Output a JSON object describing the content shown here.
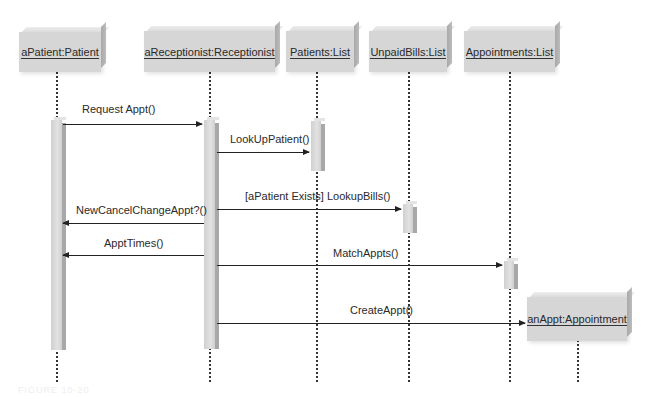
{
  "diagram": {
    "type": "UML sequence diagram",
    "objects": [
      {
        "id": "patient",
        "label": "aPatient:Patient"
      },
      {
        "id": "receptionist",
        "label": "aReceptionist:Receptionist"
      },
      {
        "id": "patients_list",
        "label": "Patients:List"
      },
      {
        "id": "unpaid_bills",
        "label": "UnpaidBills:List"
      },
      {
        "id": "appointments",
        "label": "Appointments:List"
      },
      {
        "id": "appt",
        "label": "anAppt:Appointment"
      }
    ],
    "messages": [
      {
        "label": "Request Appt()",
        "from": "patient",
        "to": "receptionist"
      },
      {
        "label": "LookUpPatient()",
        "from": "receptionist",
        "to": "patients_list"
      },
      {
        "label": "[aPatient Exists] LookupBills()",
        "from": "receptionist",
        "to": "unpaid_bills"
      },
      {
        "label": "NewCancelChangeAppt?()",
        "from": "receptionist",
        "to": "patient"
      },
      {
        "label": "ApptTimes()",
        "from": "receptionist",
        "to": "patient"
      },
      {
        "label": "MatchAppts()",
        "from": "receptionist",
        "to": "appointments"
      },
      {
        "label": "CreateAppt()",
        "from": "receptionist",
        "to": "appt"
      }
    ],
    "figure_label": "FIGURE 10-20"
  }
}
